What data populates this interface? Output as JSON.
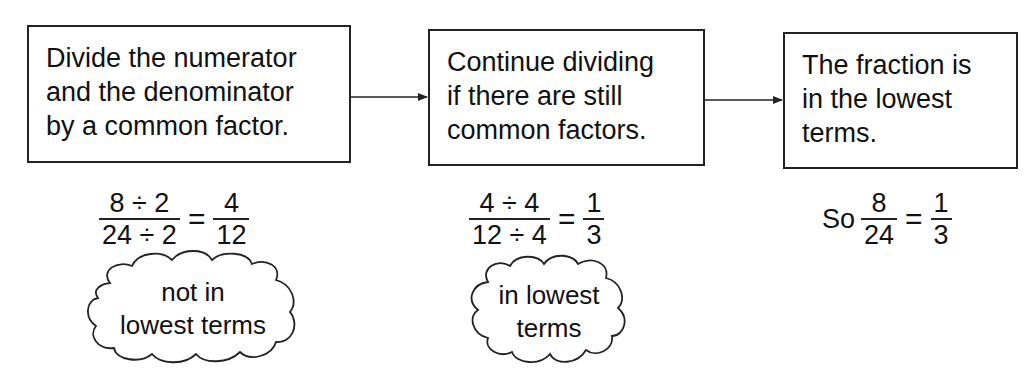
{
  "steps": [
    {
      "lines": [
        "Divide the numerator",
        "and the denominator",
        "by a common factor."
      ]
    },
    {
      "lines": [
        "Continue dividing",
        "if there are still",
        "common factors."
      ]
    },
    {
      "lines": [
        "The fraction is",
        "in the lowest",
        "terms."
      ]
    }
  ],
  "equations": [
    {
      "lhs_num": "8 ÷ 2",
      "lhs_den": "24 ÷ 2",
      "equals": "=",
      "rhs_num": "4",
      "rhs_den": "12"
    },
    {
      "lhs_num": "4 ÷ 4",
      "lhs_den": "12 ÷ 4",
      "equals": "=",
      "rhs_num": "1",
      "rhs_den": "3"
    },
    {
      "prefix": "So",
      "lhs_num": "8",
      "lhs_den": "24",
      "equals": "=",
      "rhs_num": "1",
      "rhs_den": "3"
    }
  ],
  "clouds": [
    {
      "lines": [
        "not in",
        "lowest terms"
      ]
    },
    {
      "lines": [
        "in lowest",
        "terms"
      ]
    }
  ],
  "colors": {
    "ink": "#222222",
    "background": "#ffffff"
  }
}
